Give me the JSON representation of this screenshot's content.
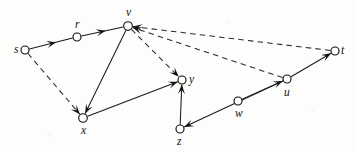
{
  "figure": {
    "kind": "directed-graph",
    "width": 356,
    "height": 152,
    "background_color": "#fdfdfb",
    "node_fill_color": "#ffffff",
    "node_stroke_color": "#121212",
    "edge_color": "#1a1a1a",
    "dashed_edge_color": "#2a2a2a"
  },
  "nodes": [
    {
      "id": "s",
      "label": "s",
      "cx": 25,
      "cy": 50,
      "r": 4.0,
      "label_dx": -11,
      "label_dy": -6
    },
    {
      "id": "r",
      "label": "r",
      "cx": 77,
      "cy": 37,
      "r": 4.0,
      "label_dx": -2,
      "label_dy": -18
    },
    {
      "id": "v",
      "label": "v",
      "cx": 128,
      "cy": 26,
      "r": 4.3,
      "label_dx": -2,
      "label_dy": -19
    },
    {
      "id": "t",
      "label": "t",
      "cx": 335,
      "cy": 51,
      "r": 4.0,
      "label_dx": 6,
      "label_dy": -6
    },
    {
      "id": "y",
      "label": "y",
      "cx": 182,
      "cy": 80,
      "r": 4.0,
      "label_dx": 7,
      "label_dy": -6
    },
    {
      "id": "x",
      "label": "x",
      "cx": 83,
      "cy": 118,
      "r": 4.3,
      "label_dx": -2,
      "label_dy": 7
    },
    {
      "id": "z",
      "label": "z",
      "cx": 180,
      "cy": 129,
      "r": 4.0,
      "label_dx": -3,
      "label_dy": 7
    },
    {
      "id": "w",
      "label": "w",
      "cx": 238,
      "cy": 101,
      "r": 4.0,
      "label_dx": -3,
      "label_dy": 7
    },
    {
      "id": "u",
      "label": "u",
      "cx": 287,
      "cy": 79,
      "r": 4.0,
      "label_dx": -3,
      "label_dy": 8
    }
  ],
  "edges": [
    {
      "from": "s",
      "to": "r",
      "style": "solid",
      "arrow": "mid",
      "arrow_pos": 0.62
    },
    {
      "from": "r",
      "to": "v",
      "style": "solid",
      "arrow": "mid",
      "arrow_pos": 0.58
    },
    {
      "from": "v",
      "to": "x",
      "style": "solid",
      "arrow": "head",
      "arrow_pos": 1.0
    },
    {
      "from": "x",
      "to": "y",
      "style": "solid",
      "arrow": "head",
      "arrow_pos": 1.0
    },
    {
      "from": "z",
      "to": "y",
      "style": "solid",
      "arrow": "head",
      "arrow_pos": 1.0
    },
    {
      "from": "w",
      "to": "u",
      "style": "solid",
      "arrow": "head",
      "arrow_pos": 1.0
    },
    {
      "from": "u",
      "to": "z",
      "style": "solid",
      "arrow": "head",
      "arrow_pos": 1.0
    },
    {
      "from": "u",
      "to": "t",
      "style": "solid",
      "arrow": "head",
      "arrow_pos": 1.0
    },
    {
      "from": "s",
      "to": "x",
      "style": "dashed",
      "arrow": "head",
      "arrow_pos": 1.0
    },
    {
      "from": "v",
      "to": "y",
      "style": "dashed",
      "arrow": "head",
      "arrow_pos": 1.0
    },
    {
      "from": "t",
      "to": "v",
      "style": "dashed",
      "arrow": "head",
      "arrow_pos": 1.0
    },
    {
      "from": "u",
      "to": "v",
      "style": "dashed",
      "arrow": "head",
      "arrow_pos": 1.0
    }
  ]
}
